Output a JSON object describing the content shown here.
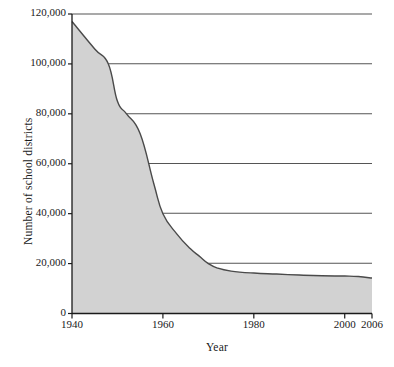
{
  "chart_data": {
    "type": "area",
    "title": "",
    "xlabel": "Year",
    "ylabel": "Number of school districts",
    "xlim": [
      1940,
      2006
    ],
    "ylim": [
      0,
      120000
    ],
    "grid": true,
    "legend": false,
    "legend_position": "none",
    "xticks": [
      1940,
      1960,
      1980,
      2000,
      2006
    ],
    "xtick_labels": [
      "1940",
      "1960",
      "1980",
      "2000",
      "2006"
    ],
    "yticks": [
      0,
      20000,
      40000,
      60000,
      80000,
      100000,
      120000
    ],
    "ytick_labels": [
      "0",
      "20,000",
      "40,000",
      "60,000",
      "80,000",
      "100,000",
      "120,000"
    ],
    "series_name": "Number of school districts",
    "x": [
      1940,
      1945,
      1948,
      1950,
      1952,
      1955,
      1958,
      1960,
      1963,
      1966,
      1968,
      1970,
      1972,
      1975,
      1980,
      1985,
      1990,
      1995,
      2000,
      2003,
      2006
    ],
    "values": [
      117000,
      106000,
      100000,
      85000,
      80000,
      72000,
      52000,
      40000,
      32000,
      26000,
      23000,
      20000,
      18200,
      17000,
      16200,
      15800,
      15400,
      15100,
      15000,
      14800,
      14200
    ],
    "annotations": [],
    "colors": {
      "area_fill": "#d2d2d2",
      "line": "#4a4a4a",
      "grid": "#4a4a4a",
      "axis": "#1a1a1a",
      "text": "#1a1a1a",
      "background": "#ffffff"
    }
  }
}
